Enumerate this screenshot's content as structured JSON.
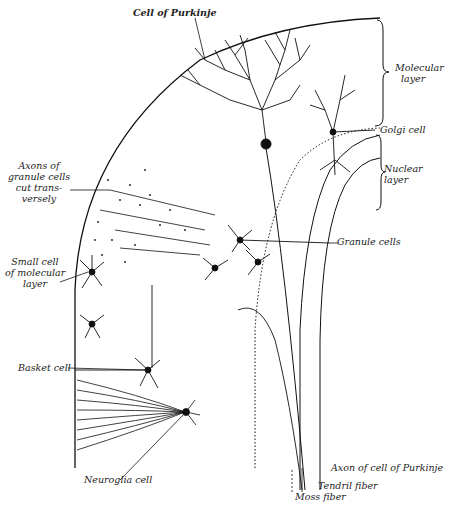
{
  "figure": {
    "stroke_color": "#111111",
    "background": "#ffffff"
  },
  "labels": {
    "cell_of_purkinje": "Cell of Purkinje",
    "molecular_layer": [
      "Molecular",
      "layer"
    ],
    "golgi_cell": "Golgi cell",
    "nuclear_layer": [
      "Nuclear",
      "layer"
    ],
    "axons_of_granule_cells": [
      "Axons of",
      "granule cells",
      "cut trans-",
      "versely"
    ],
    "granule_cells": "Granule cells",
    "small_cell_of_molecular_layer": [
      "Small cell",
      "of molecular",
      "layer"
    ],
    "basket_cell": "Basket cell",
    "neuroglia_cell": "Neuroglia cell",
    "axon_of_cell_of_purkinje": "Axon of cell of Purkinje",
    "tendril_fiber": "Tendril fiber",
    "moss_fiber": "Moss fiber"
  }
}
